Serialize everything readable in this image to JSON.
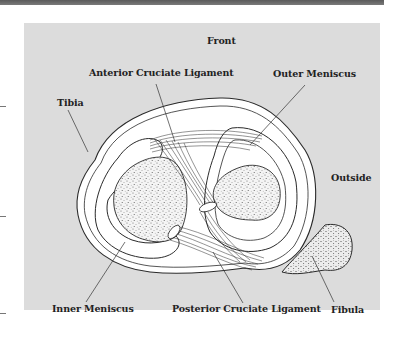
{
  "diagram": {
    "labels": {
      "front": "Front",
      "acl": "Anterior Cruciate Ligament",
      "outer_meniscus": "Outer Meniscus",
      "tibia": "Tibia",
      "outside": "Outside",
      "inner_meniscus": "Inner Meniscus",
      "pcl": "Posterior Cruciate Ligament",
      "fibula": "Fibula"
    },
    "colors": {
      "panel": "#dcdcdc",
      "outline": "#2a2a2a",
      "fill": "#ffffff",
      "stipple": "#555555"
    }
  }
}
